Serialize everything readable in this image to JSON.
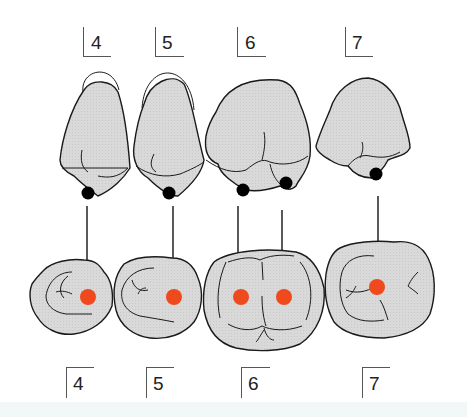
{
  "colors": {
    "tooth_fill": "#d9d9d9",
    "outline": "#1a1a1a",
    "contact_point_upper": "#000000",
    "contact_point_lower": "#ef4a1e",
    "footer_strip": "#f1f8f7"
  },
  "upper_row": {
    "description": "Upper teeth (buccal view) with contact points",
    "labels": [
      {
        "tooth": "4",
        "text": "4"
      },
      {
        "tooth": "5",
        "text": "5"
      },
      {
        "tooth": "6",
        "text": "6"
      },
      {
        "tooth": "7",
        "text": "7"
      }
    ]
  },
  "lower_row": {
    "description": "Occlusal view with target contact points (red)",
    "labels": [
      {
        "tooth": "4",
        "text": "4"
      },
      {
        "tooth": "5",
        "text": "5"
      },
      {
        "tooth": "6",
        "text": "6"
      },
      {
        "tooth": "7",
        "text": "7"
      }
    ]
  },
  "arrows": [
    {
      "from_tooth": "4",
      "count": 1
    },
    {
      "from_tooth": "5",
      "count": 1
    },
    {
      "from_tooth": "6",
      "count": 2
    },
    {
      "from_tooth": "7",
      "count": 1
    }
  ]
}
